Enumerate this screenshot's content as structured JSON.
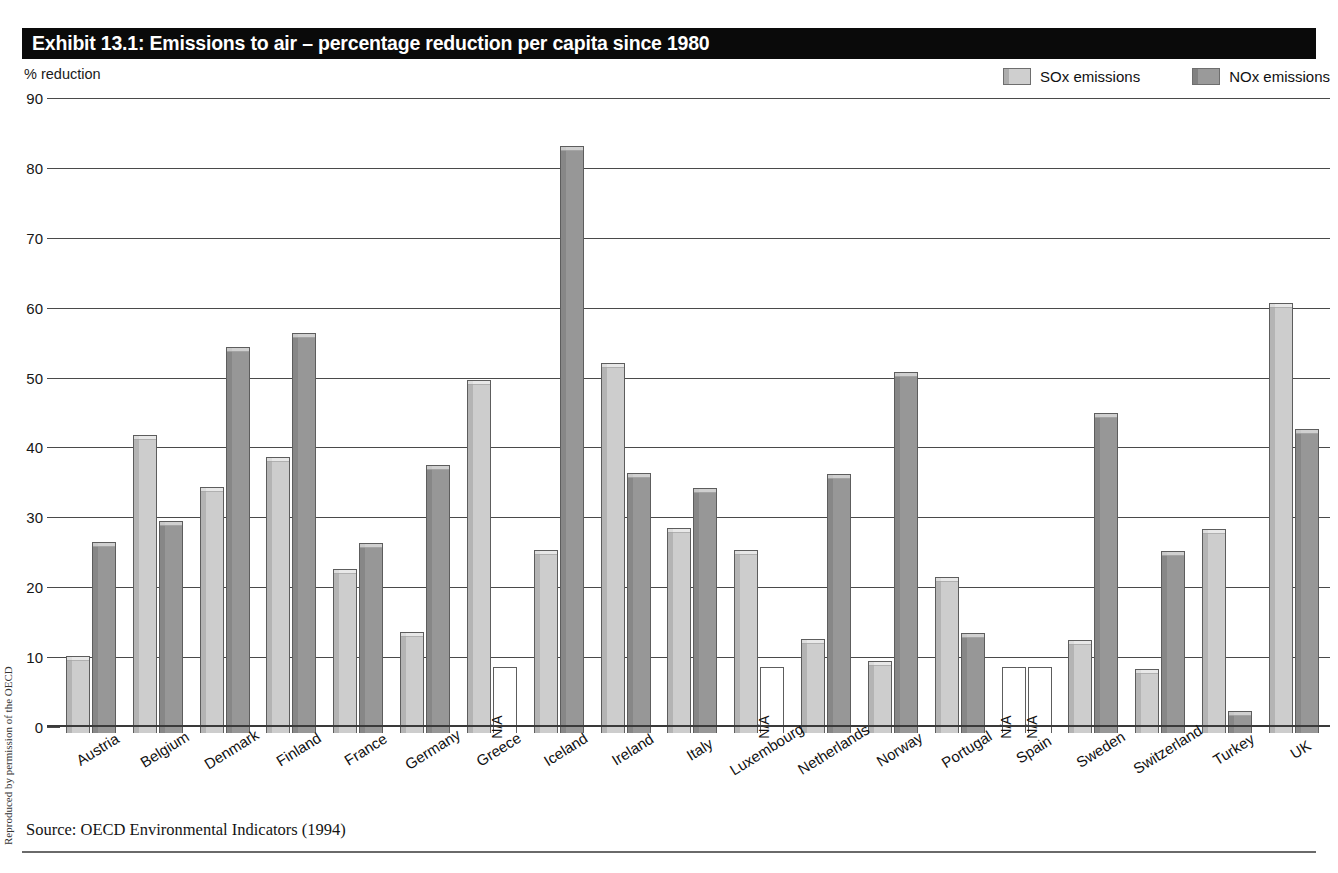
{
  "title": "Exhibit 13.1: Emissions to air – percentage reduction per capita since 1980",
  "y_caption": "% reduction",
  "side_credit": "Reproduced by permission of the OECD",
  "source": "Source: OECD Environmental Indicators (1994)",
  "legend": {
    "entries": [
      {
        "label": "SOx emissions",
        "color": "#cdcdcd",
        "key": "sox"
      },
      {
        "label": "NOx emissions",
        "color": "#979797",
        "key": "nox"
      }
    ]
  },
  "na_label": "N/A",
  "chart_data": {
    "type": "bar",
    "title": "Exhibit 13.1: Emissions to air – percentage reduction per capita since 1980",
    "xlabel": "",
    "ylabel": "% reduction",
    "ylim": [
      0,
      90
    ],
    "yticks": [
      0,
      10,
      20,
      30,
      40,
      50,
      60,
      70,
      80,
      90
    ],
    "grid": true,
    "legend_position": "top-right",
    "categories": [
      "Austria",
      "Belgium",
      "Denmark",
      "Finland",
      "France",
      "Germany",
      "Greece",
      "Iceland",
      "Ireland",
      "Italy",
      "Luxembourg",
      "Netherlands",
      "Norway",
      "Portugal",
      "Spain",
      "Sweden",
      "Switzerland",
      "Turkey",
      "UK"
    ],
    "series": [
      {
        "name": "SOx emissions",
        "color": "#cdcdcd",
        "values": [
          11.0,
          42.7,
          35.2,
          39.5,
          23.5,
          14.5,
          50.5,
          26.2,
          53.0,
          29.3,
          26.2,
          13.4,
          10.3,
          22.3,
          null,
          13.3,
          9.2,
          29.2,
          61.5
        ]
      },
      {
        "name": "NOx emissions",
        "color": "#979797",
        "values": [
          27.3,
          30.3,
          55.3,
          57.3,
          27.2,
          38.3,
          null,
          84.0,
          37.2,
          35.0,
          null,
          37.1,
          51.6,
          14.3,
          null,
          45.8,
          26.0,
          3.2,
          43.5
        ]
      }
    ]
  }
}
